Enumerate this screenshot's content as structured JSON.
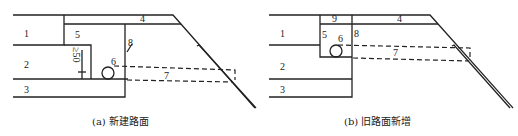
{
  "panels": [
    {
      "id": "a",
      "caption": "(a) 新建路面",
      "labels": {
        "l1": "1",
        "l2": "2",
        "l3": "3",
        "l4": "4",
        "l5": "5",
        "l6": "6",
        "l7": "7",
        "l8": "8",
        "dim": "≥50"
      }
    },
    {
      "id": "b",
      "caption": "(b) 旧路面新增",
      "labels": {
        "l1": "1",
        "l2": "2",
        "l3": "3",
        "l4": "4",
        "l5": "5",
        "l6": "6",
        "l7": "7",
        "l8": "8",
        "l9": "9"
      }
    }
  ],
  "colors": {
    "line": "#222222",
    "background": "#ffffff"
  }
}
